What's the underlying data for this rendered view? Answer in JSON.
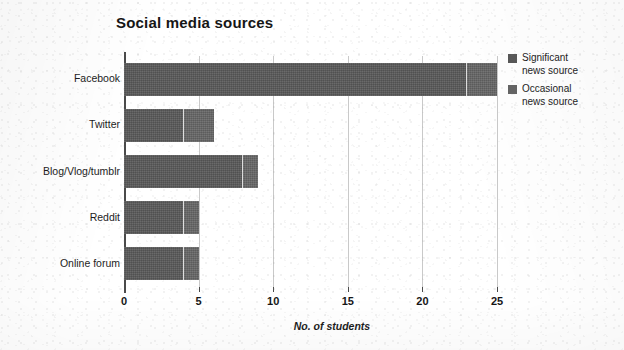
{
  "chart_data": {
    "type": "bar",
    "orientation": "horizontal",
    "stacked": true,
    "title": "Social media sources",
    "xlabel": "No. of students",
    "ylabel": "",
    "categories": [
      "Facebook",
      "Twitter",
      "Blog/Vlog/tumblr",
      "Reddit",
      "Online forum"
    ],
    "series": [
      {
        "name": "Significant news source",
        "values": [
          23,
          4,
          8,
          4,
          4
        ],
        "color": "#585858"
      },
      {
        "name": "Occasional news source",
        "values": [
          2,
          2,
          1,
          1,
          1
        ],
        "color": "#656565"
      }
    ],
    "totals": [
      25,
      6,
      9,
      5,
      5
    ],
    "xlim": [
      0,
      25
    ],
    "xticks": [
      0,
      5,
      10,
      15,
      20,
      25
    ],
    "xtick_labels": [
      "0",
      "5",
      "10",
      "15",
      "20",
      "25"
    ],
    "grid": "vertical",
    "legend_position": "right"
  },
  "legend": {
    "items": [
      {
        "label_line1": "Significant",
        "label_line2": "news source",
        "swatch": "legend-swatch-significant"
      },
      {
        "label_line1": "Occasional",
        "label_line2": "news source",
        "swatch": "legend-swatch-occasional"
      }
    ]
  }
}
